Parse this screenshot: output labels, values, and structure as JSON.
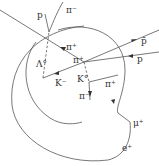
{
  "diagram": {
    "labels": {
      "p_top": "p",
      "pi_minus_top": "π⁻",
      "pi_plus_upper": "π⁺",
      "antiproton": "p̄",
      "proton_right": "p",
      "lambda": "Λ°",
      "k_minus": "K⁻",
      "pi_plus_center": "π⁺",
      "k_zero": "K°",
      "pi_minus_lower": "π⁻",
      "pi_plus_right": "π⁺",
      "mu_plus": "μ⁺",
      "e_plus": "e⁺"
    },
    "colors": {
      "track": "#555555",
      "text": "#333333",
      "background": "#ffffff"
    }
  }
}
